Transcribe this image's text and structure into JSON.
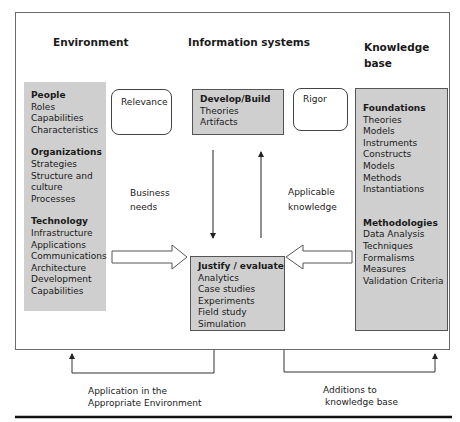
{
  "columns": {
    "environment": "Environment",
    "information_systems": "Information systems",
    "knowledge_base_line1": "Knowledge",
    "knowledge_base_line2": "base"
  },
  "environment_box": {
    "sections": [
      {
        "title": "People",
        "items": [
          "Roles",
          "Capabilities",
          "Characteristics"
        ]
      },
      {
        "title": "Organizations",
        "items": [
          "Strategies",
          "Structure and",
          "culture",
          "Processes"
        ]
      },
      {
        "title": "Technology",
        "items": [
          "Infrastructure",
          "Applications",
          "Communications",
          "Architecture",
          "Development",
          "Capabilities"
        ]
      }
    ]
  },
  "relevance_box": {
    "label": "Relevance"
  },
  "rigor_box": {
    "label": "Rigor"
  },
  "develop_build_box": {
    "title": "Develop/Build",
    "items": [
      "Theories",
      "Artifacts"
    ]
  },
  "justify_evaluate_box": {
    "title": "Justify / evaluate",
    "items": [
      "Analytics",
      "Case studies",
      "Experiments",
      "Field study",
      "Simulation"
    ]
  },
  "knowledge_box": {
    "sections": [
      {
        "title": "Foundations",
        "items": [
          "Theories",
          "Models",
          "Instruments",
          "Constructs",
          "Models",
          "Methods",
          "Instantiations"
        ]
      },
      {
        "title": "Methodologies",
        "items": [
          "Data Analysis",
          "Techniques",
          "Formalisms",
          "Measures",
          "Validation Criteria"
        ]
      }
    ]
  },
  "flow_labels": {
    "business_needs_line1": "Business",
    "business_needs_line2": "needs",
    "applicable_knowledge_line1": "Applicable",
    "applicable_knowledge_line2": "knowledge",
    "application_line1": "Application in the",
    "application_line2": "Appropriate Environment",
    "additions_line1": "Additions to",
    "additions_line2": "knowledge base"
  },
  "colors": {
    "box_fill": "#cfcfcf",
    "line": "#333333"
  }
}
